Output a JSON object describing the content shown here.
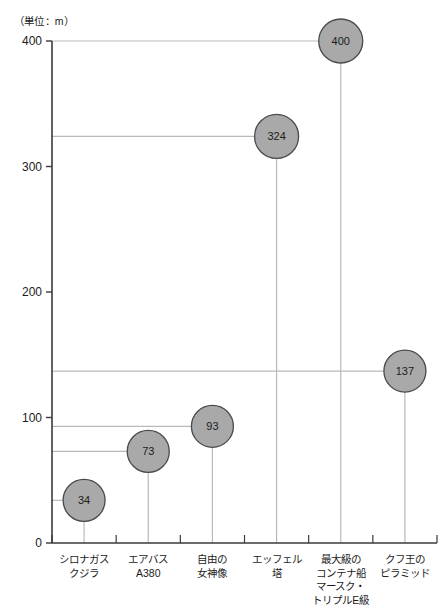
{
  "chart_data": {
    "type": "scatter",
    "title": "",
    "subtitle": "",
    "unit_note": "（単位：m）",
    "xlabel": "",
    "ylabel": "",
    "ylim": [
      0,
      400
    ],
    "ytick_labels": [
      "0",
      "100",
      "200",
      "300",
      "400"
    ],
    "ytick_values": [
      0,
      100,
      200,
      300,
      400
    ],
    "grid": false,
    "guide_lines": true,
    "legend": "none",
    "categories": [
      "シロナガス\nクジラ",
      "エアバス\nA380",
      "自由の\n女神像",
      "エッフェル\n塔",
      "最大級の\nコンテナ船\nマースク・\nトリプルE級",
      "クフ王の\nピラミッド"
    ],
    "values": [
      34,
      73,
      93,
      324,
      400,
      137
    ],
    "point_labels": [
      "34",
      "73",
      "93",
      "324",
      "400",
      "137"
    ],
    "marker_shape": "circle",
    "marker_fill": "#a9a9a9",
    "marker_stroke": "#4a4a4a",
    "axis_color": "#3a3a3a",
    "guide_color": "#b9b9b9"
  }
}
